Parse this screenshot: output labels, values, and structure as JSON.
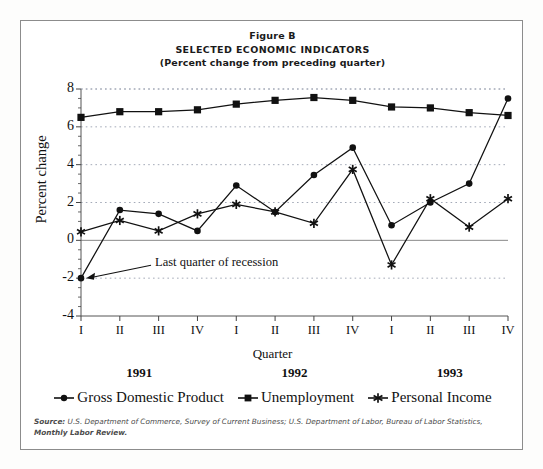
{
  "figure": {
    "title_line1": "Figure B",
    "title_line2": "SELECTED ECONOMIC INDICATORS",
    "title_line3": "(Percent change from preceding quarter)",
    "source_label": "Source:",
    "source_body": " U.S. Department of Commerce, Survey of Current Business; U.S. Department of Labor, Bureau of Labor Statistics,",
    "source_tail": "Monthly Labor Review."
  },
  "annotation": {
    "text": "Last quarter of recession"
  },
  "legend": {
    "items": [
      {
        "label": "Gross Domestic Product",
        "marker": "circle-marker",
        "color": "#111111"
      },
      {
        "label": "Unemployment",
        "marker": "square-marker",
        "color": "#111111"
      },
      {
        "label": "Personal Income",
        "marker": "star-marker",
        "color": "#111111"
      }
    ]
  },
  "years": [
    {
      "label": "1991"
    },
    {
      "label": "1992"
    },
    {
      "label": "1993"
    }
  ],
  "chart_data": {
    "type": "line",
    "title": "SELECTED ECONOMIC INDICATORS (Percent change from preceding quarter)",
    "xlabel": "Quarter",
    "ylabel": "Percent change",
    "categories": [
      "I",
      "II",
      "III",
      "IV",
      "I",
      "II",
      "III",
      "IV",
      "I",
      "II",
      "III",
      "IV"
    ],
    "group_labels": [
      "1991",
      "1992",
      "1993"
    ],
    "ylim": [
      -4,
      8
    ],
    "yticks": [
      -4,
      -2,
      0,
      2,
      4,
      6,
      8
    ],
    "ytick_labels": [
      "-4",
      "-2",
      "0",
      "2",
      "4",
      "6",
      "8"
    ],
    "minor_tick_step": 0.5,
    "grid": "horizontal-dotted-at-major-ticks",
    "legend_position": "below-plot",
    "series": [
      {
        "name": "Gross Domestic Product",
        "marker": "circle",
        "values": [
          -2.0,
          1.6,
          1.4,
          0.5,
          2.9,
          1.5,
          3.45,
          4.9,
          0.8,
          2.0,
          3.0,
          7.5
        ]
      },
      {
        "name": "Unemployment",
        "marker": "square",
        "values": [
          6.5,
          6.8,
          6.8,
          6.9,
          7.2,
          7.4,
          7.55,
          7.4,
          7.05,
          7.0,
          6.75,
          6.6
        ]
      },
      {
        "name": "Personal Income",
        "marker": "star",
        "values": [
          0.45,
          1.05,
          0.5,
          1.4,
          1.9,
          1.5,
          0.9,
          3.75,
          -1.3,
          2.2,
          0.7,
          2.2
        ]
      }
    ],
    "annotations": [
      {
        "text": "Last quarter of recession",
        "points_to_category": "I",
        "points_to_series": "Gross Domestic Product",
        "points_to_value": -2.0
      }
    ]
  }
}
